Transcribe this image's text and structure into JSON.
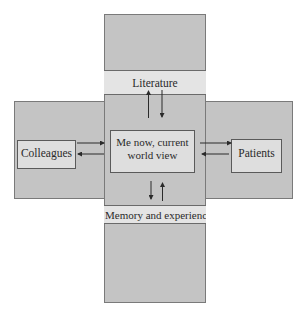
{
  "diagram": {
    "center": {
      "line1": "Me now, current",
      "line2": "world view"
    },
    "top_band": "Literature",
    "bottom_band": "Memory and experience",
    "left_box": "Colleagues",
    "right_box": "Patients",
    "edges": [
      {
        "from": "Me now, current world view",
        "to": "Literature"
      },
      {
        "from": "Literature",
        "to": "Me now, current world view"
      },
      {
        "from": "Me now, current world view",
        "to": "Memory and experience"
      },
      {
        "from": "Memory and experience",
        "to": "Me now, current world view"
      },
      {
        "from": "Colleagues",
        "to": "Me now, current world view"
      },
      {
        "from": "Me now, current world view",
        "to": "Colleagues"
      },
      {
        "from": "Me now, current world view",
        "to": "Patients"
      },
      {
        "from": "Patients",
        "to": "Me now, current world view"
      }
    ]
  },
  "colors": {
    "panel": "#c4c4c4",
    "band": "#e4e4e4",
    "box": "#dedede",
    "line": "#5a5a5a"
  }
}
